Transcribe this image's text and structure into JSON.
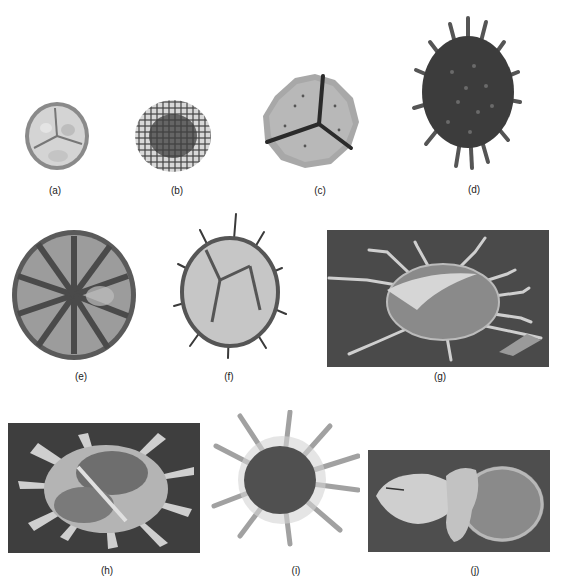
{
  "figure": {
    "panels": [
      {
        "id": "a",
        "label": "(a)",
        "type": "light-micrograph",
        "subject": "trilete spore, rounded, pale with triradiate mark"
      },
      {
        "id": "b",
        "label": "(b)",
        "type": "light-micrograph",
        "subject": "reticulate spore, dark center"
      },
      {
        "id": "c",
        "label": "(c)",
        "type": "light-micrograph",
        "subject": "trilete spore with spinose margin"
      },
      {
        "id": "d",
        "label": "(d)",
        "type": "light-micrograph",
        "subject": "dark spiny acritarch / cyst with many processes"
      },
      {
        "id": "e",
        "label": "(e)",
        "type": "light-micrograph",
        "subject": "disc with radial ribs"
      },
      {
        "id": "f",
        "label": "(f)",
        "type": "light-micrograph",
        "subject": "spiny cyst, pale with dark spines"
      },
      {
        "id": "g",
        "label": "(g)",
        "type": "SEM",
        "subject": "cyst with long branched processes on dark background"
      },
      {
        "id": "h",
        "label": "(h)",
        "type": "SEM",
        "subject": "cyst with broad membranous processes on dark background"
      },
      {
        "id": "i",
        "label": "(i)",
        "type": "light-micrograph",
        "subject": "dark cyst with translucent tubular processes"
      },
      {
        "id": "j",
        "label": "(j)",
        "type": "SEM",
        "subject": "bisaccate-like grain with sacs, on dark background"
      }
    ]
  },
  "colors": {
    "background": "#ffffff",
    "sem_bg": "#4a4a4a",
    "dark_specimen": "#3a3a3a",
    "mid_specimen": "#7a7a7a",
    "light_specimen": "#c8c8c8",
    "label": "#222222"
  }
}
